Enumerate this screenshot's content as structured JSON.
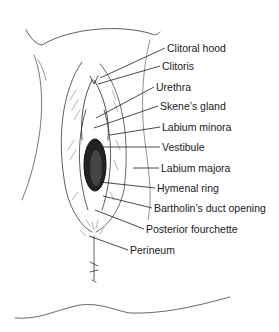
{
  "diagram": {
    "colors": {
      "ink": "#1a1a1a",
      "background": "#ffffff"
    },
    "labels": [
      {
        "id": "clitoral-hood",
        "text": "Clitoral hood",
        "x": 167,
        "y": 42,
        "line": [
          100,
          78,
          165,
          48
        ]
      },
      {
        "id": "clitoris",
        "text": "Clitoris",
        "x": 162,
        "y": 60,
        "line": [
          98,
          84,
          160,
          66
        ]
      },
      {
        "id": "urethra",
        "text": "Urethra",
        "x": 156,
        "y": 81,
        "line": [
          96,
          118,
          154,
          87
        ]
      },
      {
        "id": "skenes-gland",
        "text": "Skene’s gland",
        "x": 160,
        "y": 100,
        "line": [
          94,
          128,
          158,
          106
        ]
      },
      {
        "id": "labium-minora",
        "text": "Labium minora",
        "x": 162,
        "y": 121,
        "line": [
          110,
          135,
          160,
          127
        ]
      },
      {
        "id": "vestibule",
        "text": "Vestibule",
        "x": 162,
        "y": 141,
        "line": [
          102,
          147,
          160,
          147
        ]
      },
      {
        "id": "labium-majora",
        "text": "Labium majora",
        "x": 161,
        "y": 162,
        "line": [
          133,
          168,
          159,
          168
        ]
      },
      {
        "id": "hymenal-ring",
        "text": "Hymenal ring",
        "x": 157,
        "y": 182,
        "line": [
          100,
          182,
          155,
          188
        ]
      },
      {
        "id": "bartholins-duct-opening",
        "text": "Bartholin’s duct opening",
        "x": 154,
        "y": 202,
        "line": [
          103,
          196,
          152,
          208
        ]
      },
      {
        "id": "posterior-fourchette",
        "text": "Posterior fourchette",
        "x": 146,
        "y": 223,
        "line": [
          95,
          210,
          144,
          229
        ]
      },
      {
        "id": "perineum",
        "text": "Perineum",
        "x": 130,
        "y": 244,
        "line": [
          89,
          236,
          128,
          250
        ]
      }
    ]
  }
}
